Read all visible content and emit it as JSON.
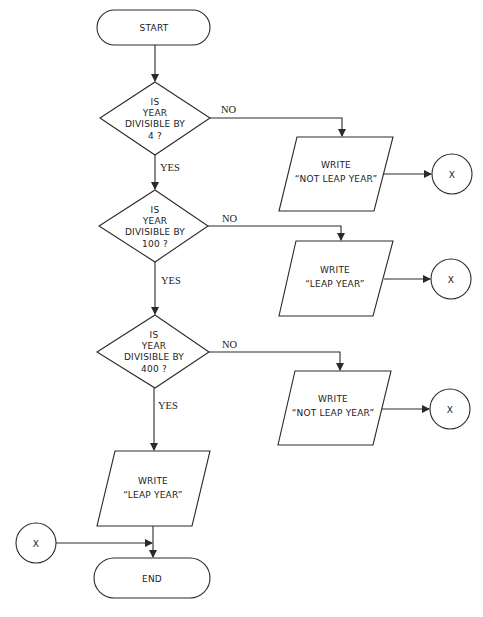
{
  "flowchart": {
    "start": {
      "label": "START"
    },
    "end": {
      "label": "END"
    },
    "decisions": [
      {
        "lines": [
          "IS",
          "YEAR",
          "DIVISIBLE  BY",
          "4 ?"
        ],
        "yes_label": "YES",
        "no_label": "NO"
      },
      {
        "lines": [
          "IS",
          "YEAR",
          "DIVISIBLE  BY",
          "100 ?"
        ],
        "yes_label": "YES",
        "no_label": "NO"
      },
      {
        "lines": [
          "IS",
          "YEAR",
          "DIVISIBLE  BY",
          "400 ?"
        ],
        "yes_label": "YES",
        "no_label": "NO"
      }
    ],
    "outputs": [
      {
        "lines": [
          "WRITE",
          "“NOT LEAP YEAR”"
        ],
        "connector": "X"
      },
      {
        "lines": [
          "WRITE",
          "“LEAP  YEAR”"
        ],
        "connector": "X"
      },
      {
        "lines": [
          "WRITE",
          "“NOT LEAP YEAR”"
        ],
        "connector": "X"
      },
      {
        "lines": [
          "WRITE",
          "“LEAP  YEAR”"
        ]
      }
    ],
    "entry_connector": {
      "label": "X"
    }
  }
}
